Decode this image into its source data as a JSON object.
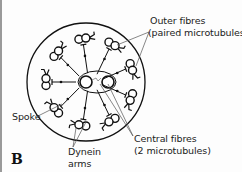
{
  "figure": {
    "panel_label": "B",
    "labels": {
      "outer_fibres": "Outer fibres",
      "outer_fibres_note": "(paired microtubules)",
      "central_fibres": "Central fibres",
      "central_fibres_note": "(2 microtubules)",
      "spoke": "Spoke",
      "dynein": "Dynein",
      "dynein_arms": "arms"
    },
    "colors": {
      "stroke": "#111111",
      "leader": "#555555",
      "background": "#fdfdfd"
    }
  }
}
